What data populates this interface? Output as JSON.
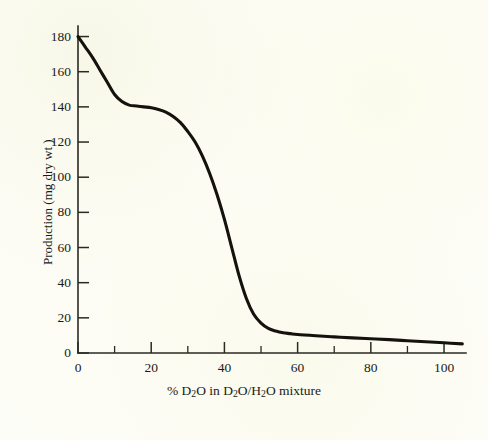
{
  "chart_data": {
    "type": "line",
    "title": "",
    "subtitle": "",
    "xlabel": "% D2O in D2O/H2O mixture",
    "xlabel_parts": {
      "prefix": "% D",
      "sub1": "2",
      "mid1": "O in D",
      "sub2": "2",
      "mid2": "O/H",
      "sub3": "2",
      "suffix": "O mixture"
    },
    "ylabel": "Production (mg dry wt )",
    "xlim": [
      0,
      106
    ],
    "ylim": [
      0,
      186
    ],
    "x_major_ticks": [
      0,
      20,
      40,
      60,
      80,
      100
    ],
    "x_major_ticklabels": [
      "0",
      "20",
      "40",
      "60",
      "80",
      "100"
    ],
    "x_minor_ticks": [
      10,
      30,
      50,
      70,
      90
    ],
    "y_major_ticks": [
      0,
      20,
      40,
      60,
      80,
      100,
      120,
      140,
      160,
      180
    ],
    "y_major_ticklabels": [
      "0",
      "20",
      "40",
      "60",
      "80",
      "100",
      "120",
      "140",
      "160",
      "180"
    ],
    "y_minor_ticks": [],
    "grid": false,
    "legend": false,
    "legend_position": "none",
    "line_color": "#15120e",
    "background_color": "#fdfdf7",
    "axis_color": "#2a2a24",
    "series": [
      {
        "name": "Production",
        "x": [
          0,
          2,
          4,
          6,
          8,
          10,
          12,
          14,
          16,
          18,
          20,
          22,
          24,
          26,
          28,
          30,
          32,
          34,
          36,
          38,
          40,
          42,
          44,
          46,
          48,
          50,
          52,
          54,
          56,
          58,
          60,
          65,
          70,
          75,
          80,
          85,
          90,
          95,
          100,
          105
        ],
        "y": [
          180,
          174,
          168,
          161,
          154,
          147,
          143,
          141,
          140.5,
          140,
          139.5,
          138.5,
          137,
          134.5,
          131,
          126,
          120,
          112,
          102,
          90,
          76,
          60,
          44,
          31,
          22,
          17,
          14,
          12.5,
          11.5,
          11,
          10.5,
          9.8,
          9.2,
          8.6,
          8.1,
          7.6,
          7.0,
          6.4,
          5.8,
          5.2
        ]
      }
    ],
    "annotations": []
  },
  "figure": {
    "caption": "",
    "source_note": ""
  }
}
